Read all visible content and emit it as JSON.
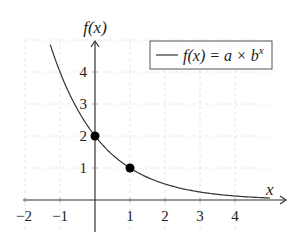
{
  "chart_data": {
    "type": "line",
    "title": "",
    "xlabel": "x",
    "ylabel": "f(x)",
    "xlim": [
      -2,
      5
    ],
    "ylim": [
      -1.3,
      5.2
    ],
    "x_ticks": [
      "−2",
      "−1",
      "1",
      "2",
      "3",
      "4"
    ],
    "y_ticks": [
      "1",
      "2",
      "3",
      "4"
    ],
    "grid": true,
    "legend_position": "upper right",
    "series": [
      {
        "name": "f(x) = a × b^x",
        "function": "2 * 0.5^x",
        "a": 2,
        "b": 0.5,
        "x_range": [
          -1.28,
          5
        ],
        "color": "#333333"
      }
    ],
    "points": [
      {
        "x": 0,
        "y": 2
      },
      {
        "x": 1,
        "y": 1
      }
    ]
  },
  "labels": {
    "y_axis": "f(x)",
    "x_axis": "x",
    "legend_text": "f(x) = a × b",
    "legend_sup": "x",
    "xt": [
      "−2",
      "−1",
      "1",
      "2",
      "3",
      "4"
    ],
    "yt": [
      "1",
      "2",
      "3",
      "4"
    ]
  }
}
